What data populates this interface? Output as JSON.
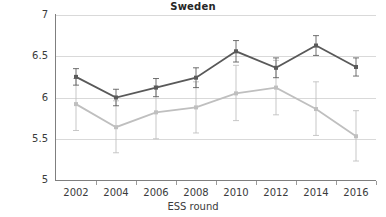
{
  "chart_data": {
    "type": "line",
    "title": "Sweden",
    "xlabel": "ESS round",
    "ylabel": "",
    "categories": [
      "2002",
      "2004",
      "2006",
      "2008",
      "2010",
      "2012",
      "2014",
      "2016"
    ],
    "ylim": [
      5,
      7
    ],
    "yticks": [
      "5",
      "5.5",
      "6",
      "6.5",
      "7"
    ],
    "ytick_values": [
      5,
      5.5,
      6,
      6.5,
      7
    ],
    "grid": true,
    "legend": "none",
    "series": [
      {
        "name": "dark-series",
        "color": "#595959",
        "values": [
          6.25,
          6.0,
          6.12,
          6.24,
          6.56,
          6.36,
          6.63,
          6.37
        ],
        "err_low": [
          6.15,
          5.9,
          6.01,
          6.12,
          6.43,
          6.24,
          6.51,
          6.26
        ],
        "err_high": [
          6.35,
          6.1,
          6.23,
          6.36,
          6.69,
          6.48,
          6.75,
          6.48
        ]
      },
      {
        "name": "light-series",
        "color": "#bfbfbf",
        "values": [
          5.92,
          5.64,
          5.82,
          5.88,
          6.05,
          6.12,
          5.86,
          5.53
        ],
        "err_low": [
          5.6,
          5.33,
          5.5,
          5.57,
          5.72,
          5.79,
          5.54,
          5.23
        ],
        "err_high": [
          6.23,
          5.96,
          6.14,
          6.19,
          6.39,
          6.45,
          6.19,
          5.84
        ]
      }
    ]
  },
  "axis": {
    "tick_years": [
      "2002",
      "2004",
      "2006",
      "2008",
      "2010",
      "2012",
      "2014",
      "2016"
    ]
  }
}
